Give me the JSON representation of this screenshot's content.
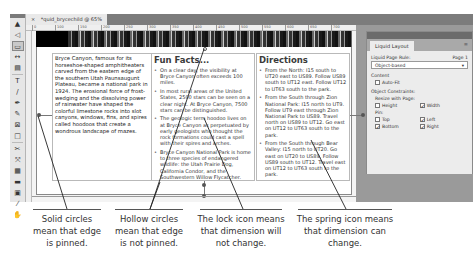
{
  "document": {
    "tab_close": "×",
    "tab_title": "*quid_brycechild @ 65%"
  },
  "ruler": {
    "ticks": [
      "0",
      "100",
      "150",
      "200",
      "250",
      "300",
      "350",
      "400",
      "450",
      "500",
      "550",
      "600",
      "650",
      "700"
    ]
  },
  "toolbox": {
    "tools": [
      {
        "name": "selection-tool",
        "glyph": "▲"
      },
      {
        "name": "direct-selection-tool",
        "glyph": "◁"
      },
      {
        "name": "page-tool",
        "glyph": "▭"
      },
      {
        "name": "gap-tool",
        "glyph": "↔"
      },
      {
        "name": "content-collector-tool",
        "glyph": "▤"
      },
      {
        "name": "type-tool",
        "glyph": "T"
      },
      {
        "name": "line-tool",
        "glyph": "/"
      },
      {
        "name": "pen-tool",
        "glyph": "✒"
      },
      {
        "name": "pencil-tool",
        "glyph": "✎"
      },
      {
        "name": "rectangle-frame-tool",
        "glyph": "⊠"
      },
      {
        "name": "rectangle-tool",
        "glyph": "□"
      },
      {
        "name": "scissors-tool",
        "glyph": "✂"
      },
      {
        "name": "free-transform-tool",
        "glyph": "⤧"
      },
      {
        "name": "gradient-swatch-tool",
        "glyph": "▦"
      },
      {
        "name": "gradient-feather-tool",
        "glyph": "▬"
      },
      {
        "name": "note-tool",
        "glyph": "▣"
      },
      {
        "name": "eyedropper-tool",
        "glyph": "⁄"
      },
      {
        "name": "hand-tool",
        "glyph": "✋"
      }
    ]
  },
  "page": {
    "intro": "Bryce Canyon, famous for its horseshoe-shaped amphitheaters carved from the eastern edge of the southern Utah Paunsaugunt Plateau, became a national park in 1924. The erosional force of frost-wedging and the dissolving power of rainwater have shaped the colorful limestone rocks into slot canyons, windows, fins, and spires called hoodoos that create a wondrous landscape of mazes.",
    "fun_facts": {
      "heading": "Fun Facts...",
      "items": [
        "On a clear day, the visibility at Bryce Canyon often exceeds 100 miles.",
        "In most rural areas of the United States, 2500 stars can be seen on a clear night. At Bryce Canyon, 7500 stars can be distinguished.",
        "The geologic term hoodoo lives on at Bryce Canyon as perpetuated by early geologists who thought the rock formations could cast a spell with their spires and arches.",
        "Bryce Canyon National Park is home to three species of endangered wildlife: the Utah Prairie Dog, California Condor, and the Southwestern Willow Flycatcher."
      ]
    },
    "directions": {
      "heading": "Directions",
      "items": [
        "From the North: I15 south to UT20 east to US89. Follow US89 south to UT12 east. Follow UT12 to UT63 south to the park.",
        "From the South through Zion National Park: I15 north to UT9. Follow UT9 east through Zion National Park to US89. Travel north on US89 to UT12. Go east on UT12 to UT63 south to the park.",
        "From the South through Bear Valley: I15 north to UT20. Go east on UT20 to US89. Follow US89 south to UT12. Travel east on UT12 to UT63 south to the park."
      ]
    }
  },
  "panel": {
    "tab": "Liquid Layout",
    "menu_icon": "≡",
    "rule_label": "Liquid Page Rule:",
    "page_label": "Page 1",
    "rule_value": "Object-based",
    "rule_arrow": "▾",
    "content_label": "Content",
    "auto_fit": "Auto-Fit",
    "constraints_label": "Object Constraints:",
    "resize_label": "Resize with Page:",
    "height": "Height",
    "width": "Width",
    "pin_label": "Pin:",
    "top": "Top",
    "left": "Left",
    "bottom": "Bottom",
    "right": "Right",
    "check": "✓",
    "states": {
      "auto_fit": false,
      "height": false,
      "width": true,
      "top": false,
      "left": true,
      "bottom": true,
      "right": true
    }
  },
  "callouts": [
    {
      "text": "Solid circles mean that edge is pinned."
    },
    {
      "text": "Hollow circles mean that edge is not pinned."
    },
    {
      "text": "The lock icon means that dimension will not change."
    },
    {
      "text": "The spring icon means that dimension can change."
    }
  ],
  "colors": {
    "app_chrome": "#9a9a9a",
    "panel_bg": "#ececec",
    "pointer": "#222222"
  }
}
